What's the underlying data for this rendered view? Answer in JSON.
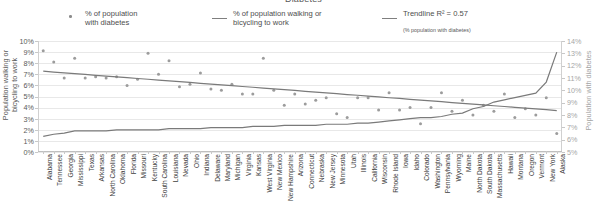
{
  "chart_data": {
    "type": "scatter",
    "title": "Diabetes",
    "xlabel": "",
    "ylabel": "Population walking or\nbicycling to work",
    "y2label": "Population with diabetes",
    "grid": true,
    "legend_position": "top",
    "ylim": [
      0,
      10
    ],
    "y2lim": [
      5,
      14
    ],
    "ytick_labels": [
      "10%",
      "9%",
      "8%",
      "7%",
      "6%",
      "5%",
      "4%",
      "3%",
      "2%",
      "1%",
      "0%"
    ],
    "y2tick_labels": [
      "14%",
      "13%",
      "12%",
      "11%",
      "10%",
      "9%",
      "8%",
      "7%",
      "6%",
      "5%"
    ],
    "categories": [
      "Alabama",
      "Tennessee",
      "Georgia",
      "Mississippi",
      "Texas",
      "Arkansas",
      "North Carolina",
      "Oklahoma",
      "Florida",
      "Missouri",
      "Kentucky",
      "South Carolina",
      "Louisiana",
      "Nevada",
      "Ohio",
      "Indiana",
      "Delaware",
      "Maryland",
      "Michigan",
      "Virginia",
      "Kansas",
      "West Virginia",
      "New Mexico",
      "New Hampshire",
      "Arizona",
      "Connecticut",
      "Nebraska",
      "New Jersey",
      "Minnesota",
      "Utah",
      "Illinois",
      "California",
      "Wisconsin",
      "Rhode Island",
      "Iowa",
      "Idaho",
      "Colorado",
      "Washington",
      "Pennsylvania",
      "Wyoming",
      "Maine",
      "North Dakota",
      "South Dakota",
      "Massachusetts",
      "Hawaii",
      "Montana",
      "Oregon",
      "Vermont",
      "New York",
      "Alaska"
    ],
    "series": [
      {
        "name": "% of population with diabetes",
        "axis": "right",
        "type": "scatter",
        "color": "#9c9c9c",
        "values": [
          13.2,
          12.3,
          11.0,
          12.6,
          11.0,
          11.1,
          11.0,
          11.1,
          10.4,
          10.9,
          13.0,
          11.3,
          12.4,
          10.3,
          10.5,
          11.4,
          10.1,
          10.0,
          10.5,
          9.7,
          9.7,
          12.6,
          10.0,
          8.8,
          9.7,
          8.9,
          9.2,
          9.4,
          8.1,
          7.8,
          9.4,
          9.4,
          8.4,
          9.8,
          8.4,
          8.6,
          7.3,
          8.6,
          9.8,
          8.3,
          9.2,
          8.0,
          8.8,
          8.3,
          9.7,
          7.8,
          8.5,
          8.0,
          9.4,
          6.5
        ]
      },
      {
        "name": "% of population walking or bicycling to work",
        "axis": "left",
        "type": "line",
        "color": "#7a7a7a",
        "values": [
          1.4,
          1.6,
          1.7,
          1.9,
          1.9,
          1.9,
          1.9,
          2.0,
          2.0,
          2.0,
          2.0,
          2.0,
          2.1,
          2.1,
          2.1,
          2.1,
          2.2,
          2.2,
          2.2,
          2.2,
          2.3,
          2.3,
          2.3,
          2.4,
          2.4,
          2.4,
          2.4,
          2.5,
          2.5,
          2.5,
          2.6,
          2.6,
          2.7,
          2.8,
          2.9,
          3.0,
          3.1,
          3.1,
          3.2,
          3.4,
          3.5,
          3.9,
          4.1,
          4.5,
          4.7,
          4.9,
          5.1,
          5.3,
          6.3,
          9.0
        ]
      },
      {
        "name": "Trendline R² = 0.57",
        "axis": "right",
        "type": "line",
        "color": "#7a7a7a",
        "values": [
          11.55,
          11.48,
          11.42,
          11.35,
          11.29,
          11.22,
          11.16,
          11.09,
          11.03,
          10.96,
          10.9,
          10.83,
          10.77,
          10.7,
          10.64,
          10.57,
          10.51,
          10.44,
          10.38,
          10.31,
          10.25,
          10.18,
          10.12,
          10.05,
          9.99,
          9.92,
          9.86,
          9.79,
          9.73,
          9.66,
          9.6,
          9.53,
          9.47,
          9.4,
          9.34,
          9.27,
          9.21,
          9.14,
          9.08,
          9.01,
          8.95,
          8.88,
          8.82,
          8.75,
          8.69,
          8.62,
          8.56,
          8.49,
          8.43,
          8.36
        ]
      }
    ]
  },
  "legend": {
    "items": [
      {
        "mark": "dot-marker",
        "label": "% of population\nwith diabetes",
        "sub": ""
      },
      {
        "mark": "line-marker",
        "label": "% of population walking or\nbicycling to work",
        "sub": ""
      },
      {
        "mark": "line-marker",
        "label": "Trendline R² = 0.57",
        "sub": "(% population with diabetes)"
      }
    ]
  },
  "colors": {
    "marker": "#9c9c9c",
    "line": "#7a7a7a",
    "trendline": "#7a7a7a",
    "grid": "#e8e8e8",
    "text": "#595959",
    "right_axis_text": "#a6a6a6"
  }
}
